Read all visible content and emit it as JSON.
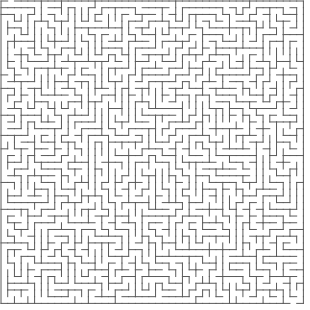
{
  "maze": {
    "rows": 45,
    "cols": 45,
    "cell_size": 6.72,
    "origin_x": 1,
    "origin_y": 1,
    "wall_color": "#5a5a5a",
    "background_color": "#ffffff",
    "wall_width": 1,
    "seed": 20240611,
    "entrance": {
      "side": "top",
      "col": 1
    },
    "exit": {
      "side": "bottom",
      "col": 43
    }
  }
}
